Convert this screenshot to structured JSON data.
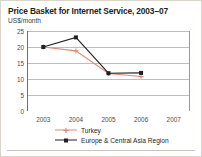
{
  "figure": {
    "title": "Price Basket for Internet Service, 2003–07",
    "subtitle": "US$/month",
    "border_color": "#d8d4cc",
    "background": "#ffffff"
  },
  "chart_data": {
    "type": "line",
    "title": "Price Basket for Internet Service, 2003–07",
    "subtitle": "US$/month",
    "xlabel": "",
    "ylabel": "US$/month",
    "x": [
      "2003",
      "2004",
      "2005",
      "2006",
      "2007"
    ],
    "categories": [
      "2003",
      "2004",
      "2005",
      "2006",
      "2007"
    ],
    "xtick_labels": [
      "2003",
      "2004",
      "2005",
      "2006",
      "2007"
    ],
    "ytick_labels": [
      "0",
      "5",
      "10",
      "15",
      "20",
      "25"
    ],
    "yticks": [
      0,
      5,
      10,
      15,
      20,
      25
    ],
    "ylim": [
      0,
      25
    ],
    "grid": "horizontal",
    "legend_position": "bottom",
    "series": [
      {
        "name": "Turkey",
        "color": "#e08a74",
        "marker": "plus",
        "values": [
          20.0,
          18.8,
          11.7,
          10.8,
          null
        ]
      },
      {
        "name": "Europe & Central Asia Region",
        "color": "#231f20",
        "marker": "square",
        "values": [
          20.0,
          23.0,
          11.8,
          11.9,
          null
        ]
      }
    ]
  },
  "legend": {
    "items": [
      {
        "label": "Turkey",
        "color": "#e08a74",
        "marker": "plus"
      },
      {
        "label": "Europe & Central Asia Region",
        "color": "#231f20",
        "marker": "square"
      }
    ]
  },
  "axes": {
    "y_tick_labels": [
      "25",
      "20",
      "15",
      "10",
      "5",
      "0"
    ],
    "x_tick_labels": [
      "2003",
      "2004",
      "2005",
      "2006",
      "2007"
    ]
  }
}
